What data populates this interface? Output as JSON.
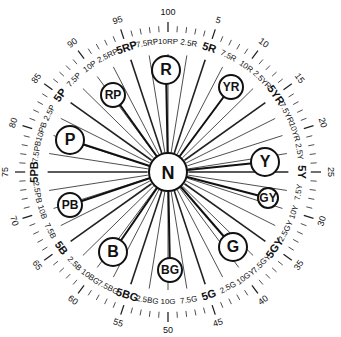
{
  "diagram": {
    "center_label": "N",
    "colors": {
      "ink": "#111111",
      "background": "#ffffff"
    },
    "hue_families": [
      "R",
      "YR",
      "Y",
      "GY",
      "G",
      "BG",
      "B",
      "PB",
      "P",
      "RP"
    ],
    "principal_hues": [
      {
        "label": "R",
        "x": 166,
        "y": 70,
        "r": 14
      },
      {
        "label": "YR",
        "x": 231,
        "y": 87,
        "r": 12
      },
      {
        "label": "Y",
        "x": 265,
        "y": 162,
        "r": 14
      },
      {
        "label": "GY",
        "x": 268,
        "y": 198,
        "r": 10
      },
      {
        "label": "G",
        "x": 233,
        "y": 247,
        "r": 14
      },
      {
        "label": "BG",
        "x": 170,
        "y": 270,
        "r": 12
      },
      {
        "label": "B",
        "x": 113,
        "y": 252,
        "r": 14
      },
      {
        "label": "PB",
        "x": 70,
        "y": 205,
        "r": 12
      },
      {
        "label": "P",
        "x": 70,
        "y": 140,
        "r": 14
      },
      {
        "label": "RP",
        "x": 113,
        "y": 95,
        "r": 12
      }
    ],
    "hue_step_labels": [
      "2.5R",
      "5R",
      "7.5R",
      "10R",
      "2.5YR",
      "5YR",
      "7.5YR",
      "10YR",
      "2.5Y",
      "5Y",
      "7.5Y",
      "10Y",
      "2.5GY",
      "5GY",
      "7.5GY",
      "10GY",
      "2.5G",
      "5G",
      "7.5G",
      "10G",
      "2.5BG",
      "5BG",
      "7.5BG",
      "10BG",
      "2.5B",
      "5B",
      "7.5B",
      "10B",
      "2.5PB",
      "5PB",
      "7.5PB",
      "10PB",
      "2.5P",
      "5P",
      "7.5P",
      "10P",
      "2.5RP",
      "5RP",
      "7.5RP",
      "10RP"
    ],
    "number_labels": [
      "5",
      "10",
      "15",
      "20",
      "25",
      "30",
      "35",
      "40",
      "45",
      "50",
      "55",
      "60",
      "65",
      "70",
      "75",
      "80",
      "85",
      "90",
      "95",
      "100"
    ]
  }
}
